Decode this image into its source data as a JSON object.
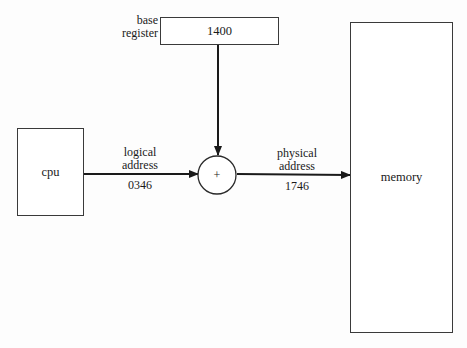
{
  "diagram": {
    "nodes": {
      "cpu": {
        "label": "cpu"
      },
      "base_register": {
        "label": "base\nregister",
        "label_line1": "base",
        "label_line2": "register",
        "value": "1400"
      },
      "adder": {
        "symbol": "+"
      },
      "memory": {
        "label": "memory"
      }
    },
    "edges": {
      "cpu_to_adder": {
        "label_line1": "logical",
        "label_line2": "address",
        "value": "0346"
      },
      "base_to_adder": {},
      "adder_to_memory": {
        "label_line1": "physical",
        "label_line2": "address",
        "value": "1746"
      }
    },
    "colors": {
      "line": "#1a1a1a",
      "box_border": "#3a3a3a",
      "background": "#fdfdfd"
    }
  }
}
